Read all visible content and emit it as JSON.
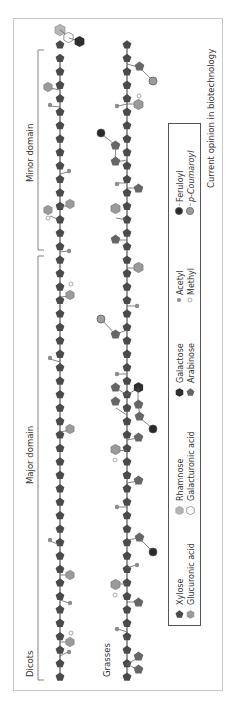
{
  "figure": {
    "credit": "Current opinion in biotechnology",
    "colors": {
      "frame": "#c8c8c8",
      "backbone_line": "#555555",
      "xylose": "#4a4a4a",
      "glucuronic_acid": "#9a9a9a",
      "rhamnose": "#b5b5b5",
      "galacturonic_acid": "#ffffff",
      "galactose": "#2e2e2e",
      "arabinose": "#666666",
      "acetyl": "#8c8c8c",
      "methyl": "#ffffff",
      "feruloyl": "#2a2a2a",
      "p_coumaroyl": "#9d9d9d",
      "text": "#333333"
    },
    "rows": [
      {
        "id": "dicots",
        "label": "Dicots"
      },
      {
        "id": "grasses",
        "label": "Grasses"
      }
    ],
    "domains": [
      {
        "id": "major",
        "label": "Major domain"
      },
      {
        "id": "minor",
        "label": "Minor domain"
      }
    ],
    "legend": [
      {
        "symbol": "xylose",
        "label": "Xylose"
      },
      {
        "symbol": "glucuronic_acid",
        "label": "Glucuronic acid"
      },
      {
        "symbol": "rhamnose",
        "label": "Rhamnose"
      },
      {
        "symbol": "galacturonic_acid",
        "label": "Galacturonic acid"
      },
      {
        "symbol": "galactose",
        "label": "Galactose"
      },
      {
        "symbol": "arabinose",
        "label": "Arabinose"
      },
      {
        "symbol": "acetyl",
        "label": "Acetyl"
      },
      {
        "symbol": "methyl",
        "label": "Methyl"
      },
      {
        "symbol": "feruloyl",
        "label": "Feruloyl"
      },
      {
        "symbol": "p_coumaroyl",
        "label": "p-Coumaroyl"
      }
    ]
  }
}
